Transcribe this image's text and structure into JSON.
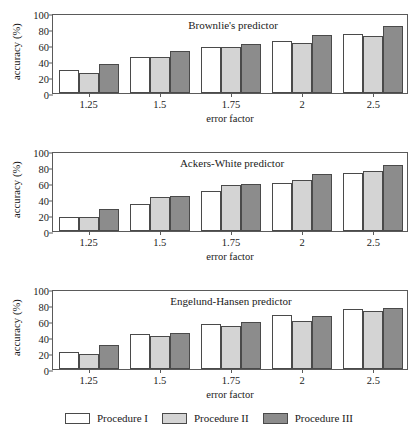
{
  "figure": {
    "panel_count": 3
  },
  "legend": {
    "position": "bottom-center",
    "items": [
      {
        "label": "Procedure I",
        "color": "#ffffff",
        "key": "p1"
      },
      {
        "label": "Procedure II",
        "color": "#d4d4d4",
        "key": "p2"
      },
      {
        "label": "Procedure III",
        "color": "#8c8c8c",
        "key": "p3"
      }
    ]
  },
  "axes": {
    "ylabel": "accuracy (%)",
    "xlabel": "error factor",
    "yticks": [
      "0",
      "20",
      "40",
      "60",
      "80",
      "100"
    ],
    "ylim": [
      0,
      100
    ],
    "xticks": [
      "1.25",
      "1.5",
      "1.75",
      "2",
      "2.5"
    ]
  },
  "chart_data": [
    {
      "type": "bar",
      "title": "Brownlie's predictor",
      "xlabel": "error factor",
      "ylabel": "accuracy (%)",
      "ylim": [
        0,
        100
      ],
      "yticks": [
        0,
        20,
        40,
        60,
        80,
        100
      ],
      "grid": false,
      "legend_position": "figure-bottom",
      "categories": [
        "1.25",
        "1.5",
        "1.75",
        "2",
        "2.5"
      ],
      "series": [
        {
          "name": "Procedure I",
          "values": [
            29,
            45.5,
            58,
            65,
            73.5
          ]
        },
        {
          "name": "Procedure II",
          "values": [
            25,
            45.5,
            57,
            62.5,
            71.5
          ]
        },
        {
          "name": "Procedure III",
          "values": [
            36,
            52,
            61.5,
            72,
            83.5
          ]
        }
      ]
    },
    {
      "type": "bar",
      "title": "Ackers-White predictor",
      "xlabel": "error factor",
      "ylabel": "accuracy (%)",
      "ylim": [
        0,
        100
      ],
      "yticks": [
        0,
        20,
        40,
        60,
        80,
        100
      ],
      "grid": false,
      "legend_position": "figure-bottom",
      "categories": [
        "1.25",
        "1.5",
        "1.75",
        "2",
        "2.5"
      ],
      "series": [
        {
          "name": "Procedure I",
          "values": [
            18,
            33.5,
            49.5,
            60.5,
            72
          ]
        },
        {
          "name": "Procedure II",
          "values": [
            18,
            43,
            57,
            63.5,
            75
          ]
        },
        {
          "name": "Procedure III",
          "values": [
            28,
            44,
            58.5,
            71,
            82
          ]
        }
      ]
    },
    {
      "type": "bar",
      "title": "Engelund-Hansen predictor",
      "xlabel": "error factor",
      "ylabel": "accuracy (%)",
      "ylim": [
        0,
        100
      ],
      "yticks": [
        0,
        20,
        40,
        60,
        80,
        100
      ],
      "grid": false,
      "legend_position": "figure-bottom",
      "categories": [
        "1.25",
        "1.5",
        "1.75",
        "2",
        "2.5"
      ],
      "series": [
        {
          "name": "Procedure I",
          "values": [
            21,
            43.5,
            56,
            67.5,
            75
          ]
        },
        {
          "name": "Procedure II",
          "values": [
            19,
            41.5,
            53.5,
            60.5,
            73
          ]
        },
        {
          "name": "Procedure III",
          "values": [
            30,
            45.5,
            58.5,
            66,
            76.5
          ]
        }
      ]
    }
  ]
}
